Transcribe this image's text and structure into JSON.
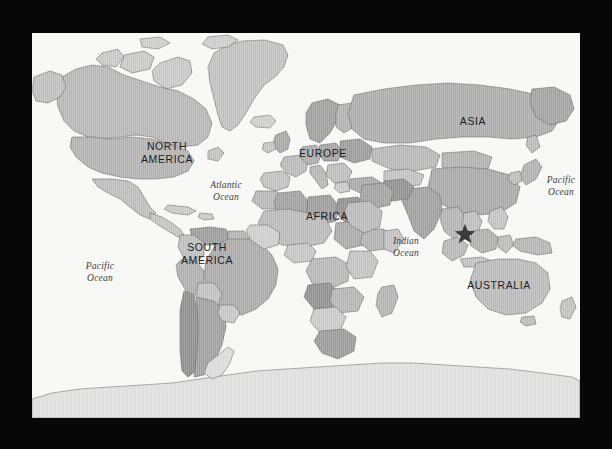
{
  "image": {
    "kind": "world-map",
    "background_color": "#070707",
    "map_background_color": "#f7f7f5",
    "projection": "mercator-like world map",
    "land_outline_color": "#555555"
  },
  "continent_labels": [
    {
      "id": "north-america",
      "lines": [
        "NORTH",
        "AMERICA"
      ],
      "x": 106,
      "y": 107
    },
    {
      "id": "south-america",
      "lines": [
        "SOUTH",
        "AMERICA"
      ],
      "x": 146,
      "y": 208
    },
    {
      "id": "europe",
      "lines": [
        "EUROPE"
      ],
      "x": 266,
      "y": 114
    },
    {
      "id": "africa",
      "lines": [
        "AFRICA"
      ],
      "x": 271,
      "y": 177
    },
    {
      "id": "asia",
      "lines": [
        "ASIA"
      ],
      "x": 423,
      "y": 82
    },
    {
      "id": "australia",
      "lines": [
        "AUSTRALIA"
      ],
      "x": 432,
      "y": 246
    }
  ],
  "ocean_labels": [
    {
      "id": "pacific-ocean-west",
      "lines": [
        "Pacific",
        "Ocean"
      ],
      "x": 44,
      "y": 228
    },
    {
      "id": "atlantic-ocean",
      "lines": [
        "Atlantic",
        "Ocean"
      ],
      "x": 168,
      "y": 147
    },
    {
      "id": "indian-ocean",
      "lines": [
        "Indian",
        "Ocean"
      ],
      "x": 351,
      "y": 203
    },
    {
      "id": "pacific-ocean-east",
      "lines": [
        "Pacific",
        "Ocean"
      ],
      "x": 506,
      "y": 142
    }
  ],
  "marker": {
    "id": "location-star",
    "shape": "star",
    "color": "#3b3b3b",
    "x": 433,
    "y": 201,
    "size": 20,
    "region": "Borneo / Southeast Asia"
  },
  "shading": {
    "note": "Countries rendered in varied grayscale tints",
    "tints": [
      "#d9d9d9",
      "#cfcfcf",
      "#c4c4c4",
      "#b9b9b9",
      "#aeaeae",
      "#a3a3a3",
      "#999999",
      "#8e8e8e",
      "#e4e4e4",
      "#efefef"
    ]
  }
}
